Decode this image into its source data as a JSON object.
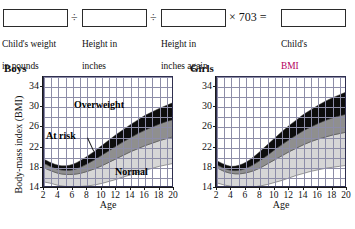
{
  "formula": {
    "boxes": [
      {
        "id": "weight-box",
        "value": ""
      },
      {
        "id": "height-box",
        "value": ""
      },
      {
        "id": "height-again-box",
        "value": ""
      },
      {
        "id": "bmi-box",
        "value": ""
      }
    ],
    "operators": [
      {
        "id": "divide-1",
        "symbol": "÷"
      },
      {
        "id": "divide-2",
        "symbol": "÷"
      },
      {
        "id": "times-703",
        "symbol": "× 703 ="
      }
    ],
    "captions": [
      {
        "id": "weight-caption",
        "line1": "Child's weight",
        "line2": "in pounds"
      },
      {
        "id": "height-caption",
        "line1": "Height in",
        "line2": "inches"
      },
      {
        "id": "height-again-caption",
        "line1": "Height in",
        "line2": "inches again"
      },
      {
        "id": "bmi-caption",
        "line1": "Child's",
        "line2": "BMI"
      }
    ],
    "bmi_accent_color": "#b3005e"
  },
  "charts": {
    "boys": {
      "title": "Boys",
      "xlabel": "Age",
      "ylabel": "Body-mass index (BMI)"
    },
    "girls": {
      "title": "Girls",
      "xlabel": "Age",
      "ylabel": ""
    },
    "band_labels": {
      "overweight": "Overweight",
      "at_risk": "At risk",
      "normal": "Normal"
    },
    "colors": {
      "normal_band": "#d6d6d6",
      "at_risk_band": "#8f8f8f",
      "overweight_band": "#0d0d0d",
      "gridline": "#8d8da8",
      "axis": "#1b1b1b"
    }
  },
  "chart_data": [
    {
      "type": "area",
      "id": "boys-bmi-percentile-chart",
      "title": "Boys",
      "xlabel": "Age",
      "ylabel": "Body-mass index (BMI)",
      "xlim": [
        2,
        20
      ],
      "ylim": [
        14,
        36
      ],
      "xticks": [
        2,
        4,
        6,
        8,
        10,
        12,
        14,
        16,
        18,
        20
      ],
      "yticks": [
        14,
        18,
        22,
        26,
        30,
        34
      ],
      "grid": true,
      "legend": "inline-annotations",
      "annotations": [
        "Overweight",
        "At risk",
        "Normal"
      ],
      "x": [
        2,
        3,
        4,
        5,
        6,
        7,
        8,
        9,
        10,
        11,
        12,
        13,
        14,
        15,
        16,
        17,
        18,
        19,
        20
      ],
      "series": [
        {
          "name": "Normal lower bound (5th percentile)",
          "values": [
            15.2,
            14.9,
            14.5,
            14.3,
            14.2,
            14.3,
            14.4,
            14.6,
            14.9,
            15.3,
            15.7,
            16.2,
            16.6,
            17.1,
            17.5,
            17.9,
            18.3,
            18.6,
            18.9
          ]
        },
        {
          "name": "At risk lower bound (85th percentile)",
          "values": [
            18.0,
            17.4,
            16.9,
            16.7,
            16.7,
            16.9,
            17.3,
            17.8,
            18.4,
            19.1,
            19.8,
            20.5,
            21.2,
            21.8,
            22.4,
            22.9,
            23.4,
            23.8,
            24.2
          ]
        },
        {
          "name": "Overweight lower bound (95th percentile)",
          "values": [
            18.9,
            18.2,
            17.7,
            17.5,
            17.6,
            18.1,
            18.8,
            19.6,
            20.5,
            21.4,
            22.3,
            23.2,
            24.0,
            24.8,
            25.5,
            26.1,
            26.7,
            27.2,
            27.6
          ]
        },
        {
          "name": "Overweight upper bound (chart cap)",
          "values": [
            19.7,
            19.0,
            18.5,
            18.4,
            18.7,
            19.4,
            20.3,
            21.3,
            22.4,
            23.5,
            24.6,
            25.6,
            26.6,
            27.5,
            28.4,
            29.1,
            29.8,
            30.4,
            31.0
          ]
        }
      ]
    },
    {
      "type": "area",
      "id": "girls-bmi-percentile-chart",
      "title": "Girls",
      "xlabel": "Age",
      "ylabel": "",
      "xlim": [
        2,
        20
      ],
      "ylim": [
        14,
        36
      ],
      "xticks": [
        2,
        4,
        6,
        8,
        10,
        12,
        14,
        16,
        18,
        20
      ],
      "yticks": [
        14,
        18,
        22,
        26,
        30,
        34
      ],
      "grid": true,
      "legend": "none",
      "annotations": [],
      "x": [
        2,
        3,
        4,
        5,
        6,
        7,
        8,
        9,
        10,
        11,
        12,
        13,
        14,
        15,
        16,
        17,
        18,
        19,
        20
      ],
      "series": [
        {
          "name": "Normal lower bound (5th percentile)",
          "values": [
            15.0,
            14.6,
            14.3,
            14.1,
            14.1,
            14.2,
            14.4,
            14.7,
            15.1,
            15.5,
            16.0,
            16.5,
            16.9,
            17.3,
            17.6,
            17.9,
            18.1,
            18.3,
            18.5
          ]
        },
        {
          "name": "At risk lower bound (85th percentile)",
          "values": [
            18.0,
            17.3,
            16.9,
            16.8,
            17.0,
            17.4,
            18.0,
            18.8,
            19.6,
            20.4,
            21.2,
            21.9,
            22.6,
            23.2,
            23.7,
            24.1,
            24.5,
            24.8,
            25.1
          ]
        },
        {
          "name": "Overweight lower bound (95th percentile)",
          "values": [
            18.6,
            17.9,
            17.5,
            17.5,
            17.9,
            18.6,
            19.5,
            20.5,
            21.6,
            22.6,
            23.6,
            24.5,
            25.4,
            26.1,
            26.8,
            27.4,
            27.9,
            28.3,
            28.7
          ]
        },
        {
          "name": "Overweight upper bound (chart cap)",
          "values": [
            19.4,
            18.7,
            18.3,
            18.5,
            19.1,
            20.1,
            21.3,
            22.6,
            23.9,
            25.2,
            26.4,
            27.5,
            28.6,
            29.5,
            30.4,
            31.2,
            31.9,
            32.5,
            33.1
          ]
        }
      ]
    }
  ]
}
